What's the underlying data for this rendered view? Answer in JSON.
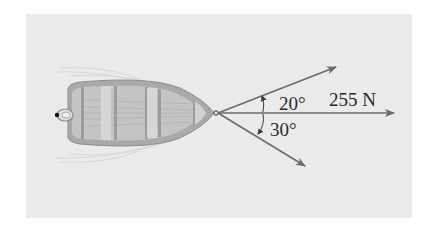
{
  "figure": {
    "labels": {
      "upper_angle": "20°",
      "lower_angle": "30°",
      "resultant_force": "255 N"
    },
    "colors": {
      "background_panel": "#ebebeb",
      "boat_hull": "#a9a9a9",
      "boat_interior": "#c4c4c4",
      "boat_seats": "#d6d6d6",
      "arrows": "#6b6b6b",
      "text": "#2a2a2a"
    },
    "vectors": [
      {
        "name": "rope-upper",
        "angle_deg_from_axis": 20,
        "direction": "above"
      },
      {
        "name": "resultant",
        "angle_deg_from_axis": 0,
        "magnitude_label": "255 N"
      },
      {
        "name": "rope-lower",
        "angle_deg_from_axis": 30,
        "direction": "below"
      }
    ]
  }
}
